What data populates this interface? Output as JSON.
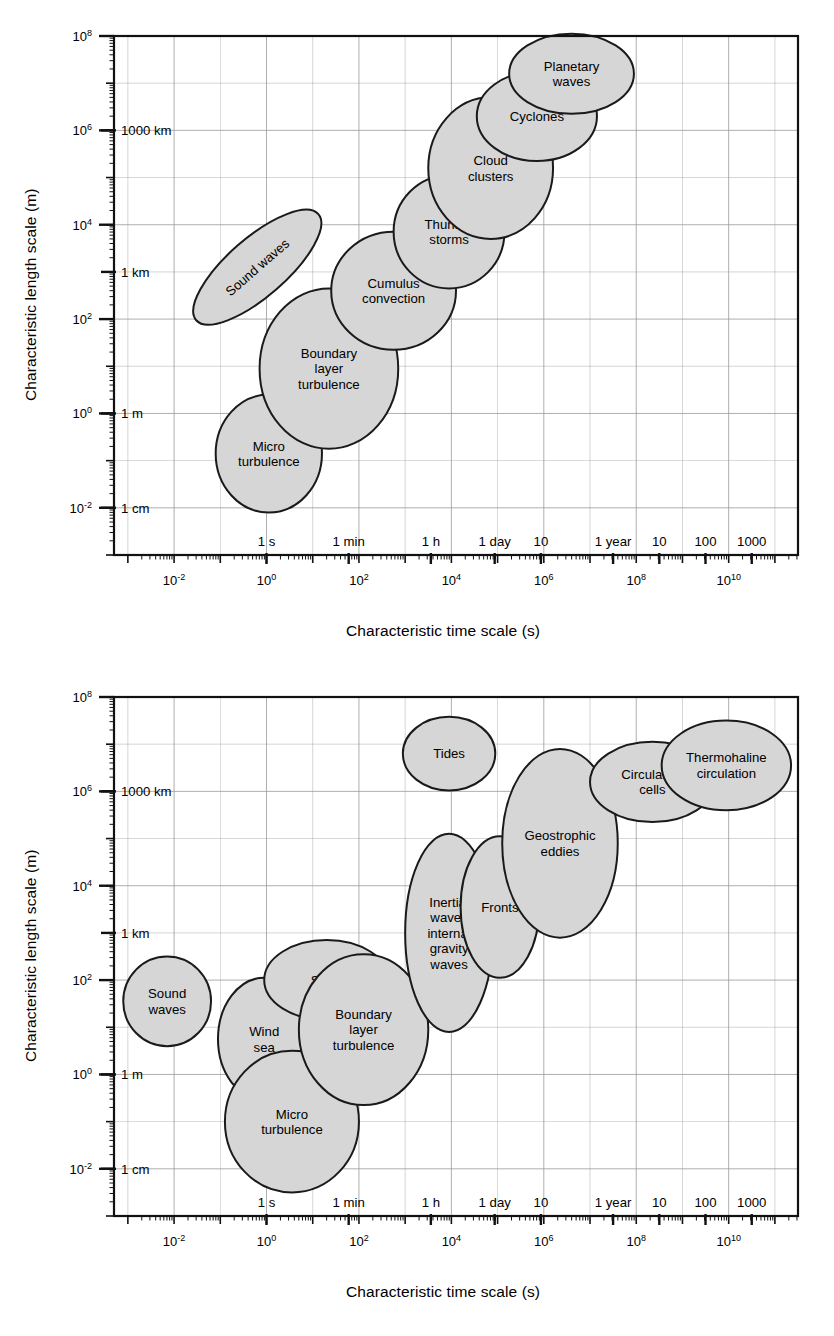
{
  "figure": {
    "panels": [
      {
        "id": "atmosphere",
        "xlabel": "Characteristic time scale (s)",
        "ylabel": "Characteristic length scale (m)"
      },
      {
        "id": "ocean",
        "xlabel": "Characteristic time scale (s)",
        "ylabel": "Characteristic length scale (m)"
      }
    ]
  },
  "chart_data": [
    {
      "type": "scatter",
      "id": "atmospheric-scales",
      "title": "",
      "xlabel": "Characteristic time scale (s)",
      "ylabel": "Characteristic length scale (m)",
      "xscale": "log",
      "yscale": "log",
      "xlim": [
        -3.3,
        11.5
      ],
      "ylim": [
        -3.0,
        8.0
      ],
      "grid": true,
      "legend": "none",
      "x_decade_ticks": [
        "10-2",
        "100",
        "102",
        "104",
        "106",
        "108",
        "1010"
      ],
      "x_decade_values": [
        -2,
        0,
        2,
        4,
        6,
        8,
        10
      ],
      "x_named_ticks": [
        {
          "label": "1 s",
          "log10_seconds": 0
        },
        {
          "label": "1 min",
          "log10_seconds": 1.778
        },
        {
          "label": "1 h",
          "log10_seconds": 3.556
        },
        {
          "label": "1 day",
          "log10_seconds": 4.937
        },
        {
          "label": "10",
          "log10_seconds": 5.937
        },
        {
          "label": "1 year",
          "log10_seconds": 7.499
        },
        {
          "label": "10",
          "log10_seconds": 8.499
        },
        {
          "label": "100",
          "log10_seconds": 9.499
        },
        {
          "label": "1000",
          "log10_seconds": 10.499
        }
      ],
      "y_decade_ticks": [
        "108",
        "106",
        "104",
        "102",
        "100",
        "10-2"
      ],
      "y_decade_values": [
        8,
        6,
        4,
        2,
        0,
        -2
      ],
      "y_named_ticks": [
        {
          "label": "1000 km",
          "log10_metres": 6
        },
        {
          "label": "1 km",
          "log10_metres": 3
        },
        {
          "label": "1 m",
          "log10_metres": 0
        },
        {
          "label": "1 cm",
          "log10_metres": -2
        }
      ],
      "bubbles": [
        {
          "label": "Micro turbulence",
          "lines": [
            "Micro",
            "turbulence"
          ],
          "cx_log10s": 0.05,
          "cy_log10m": -0.85,
          "rx_dec": 1.15,
          "ry_dec": 1.25,
          "rotate": 0
        },
        {
          "label": "Boundary layer turbulence",
          "lines": [
            "Boundary",
            "layer",
            "turbulence"
          ],
          "cx_log10s": 1.35,
          "cy_log10m": 0.95,
          "rx_dec": 1.5,
          "ry_dec": 1.7,
          "rotate": 0
        },
        {
          "label": "Sound waves",
          "lines": [
            "Sound waves"
          ],
          "cx_log10s": -0.2,
          "cy_log10m": 3.1,
          "rx_dec": 1.75,
          "ry_dec": 0.62,
          "rotate": -41
        },
        {
          "label": "Cumulus convection",
          "lines": [
            "Cumulus",
            "convection"
          ],
          "cx_log10s": 2.75,
          "cy_log10m": 2.6,
          "rx_dec": 1.35,
          "ry_dec": 1.25,
          "rotate": 0
        },
        {
          "label": "Thunder storms",
          "lines": [
            "Thunder",
            "storms"
          ],
          "cx_log10s": 3.95,
          "cy_log10m": 3.85,
          "rx_dec": 1.2,
          "ry_dec": 1.2,
          "rotate": 0
        },
        {
          "label": "Cloud clusters",
          "lines": [
            "Cloud",
            "clusters"
          ],
          "cx_log10s": 4.85,
          "cy_log10m": 5.2,
          "rx_dec": 1.35,
          "ry_dec": 1.5,
          "rotate": 0
        },
        {
          "label": "Cyclones",
          "lines": [
            "Cyclones"
          ],
          "cx_log10s": 5.85,
          "cy_log10m": 6.3,
          "rx_dec": 1.3,
          "ry_dec": 0.95,
          "rotate": 0
        },
        {
          "label": "Planetary waves",
          "lines": [
            "Planetary",
            "waves"
          ],
          "cx_log10s": 6.6,
          "cy_log10m": 7.2,
          "rx_dec": 1.35,
          "ry_dec": 0.85,
          "rotate": 0
        }
      ]
    },
    {
      "type": "scatter",
      "id": "oceanic-scales",
      "title": "",
      "xlabel": "Characteristic time scale (s)",
      "ylabel": "Characteristic length scale (m)",
      "xscale": "log",
      "yscale": "log",
      "xlim": [
        -3.3,
        11.5
      ],
      "ylim": [
        -3.0,
        8.0
      ],
      "grid": true,
      "legend": "none",
      "x_decade_ticks": [
        "10-2",
        "100",
        "102",
        "104",
        "106",
        "108",
        "1010"
      ],
      "x_decade_values": [
        -2,
        0,
        2,
        4,
        6,
        8,
        10
      ],
      "x_named_ticks": [
        {
          "label": "1 s",
          "log10_seconds": 0
        },
        {
          "label": "1 min",
          "log10_seconds": 1.778
        },
        {
          "label": "1 h",
          "log10_seconds": 3.556
        },
        {
          "label": "1 day",
          "log10_seconds": 4.937
        },
        {
          "label": "10",
          "log10_seconds": 5.937
        },
        {
          "label": "1 year",
          "log10_seconds": 7.499
        },
        {
          "label": "10",
          "log10_seconds": 8.499
        },
        {
          "label": "100",
          "log10_seconds": 9.499
        },
        {
          "label": "1000",
          "log10_seconds": 10.499
        }
      ],
      "y_decade_ticks": [
        "108",
        "106",
        "104",
        "102",
        "100",
        "10-2"
      ],
      "y_decade_values": [
        8,
        6,
        4,
        2,
        0,
        -2
      ],
      "y_named_ticks": [
        {
          "label": "1000 km",
          "log10_metres": 6
        },
        {
          "label": "1 km",
          "log10_metres": 3
        },
        {
          "label": "1 m",
          "log10_metres": 0
        },
        {
          "label": "1 cm",
          "log10_metres": -2
        }
      ],
      "bubbles": [
        {
          "label": "Sound waves",
          "lines": [
            "Sound",
            "waves"
          ],
          "cx_log10s": -2.15,
          "cy_log10m": 1.55,
          "rx_dec": 0.95,
          "ry_dec": 0.95,
          "rotate": 0
        },
        {
          "label": "Wind sea",
          "lines": [
            "Wind",
            "sea"
          ],
          "cx_log10s": -0.05,
          "cy_log10m": 0.75,
          "rx_dec": 1.0,
          "ry_dec": 1.3,
          "rotate": 0
        },
        {
          "label": "Micro turbulence",
          "lines": [
            "Micro",
            "turbulence"
          ],
          "cx_log10s": 0.55,
          "cy_log10m": -1.0,
          "rx_dec": 1.45,
          "ry_dec": 1.5,
          "rotate": 0
        },
        {
          "label": "Swell",
          "lines": [
            "Swell"
          ],
          "cx_log10s": 1.3,
          "cy_log10m": 2.0,
          "rx_dec": 1.35,
          "ry_dec": 0.85,
          "rotate": 0
        },
        {
          "label": "Boundary layer turbulence",
          "lines": [
            "Boundary",
            "layer",
            "turbulence"
          ],
          "cx_log10s": 2.1,
          "cy_log10m": 0.95,
          "rx_dec": 1.4,
          "ry_dec": 1.6,
          "rotate": 0
        },
        {
          "label": "Inertial waves internal gravity waves",
          "lines": [
            "Inertial",
            "waves",
            "internal",
            "gravity",
            "waves"
          ],
          "cx_log10s": 3.95,
          "cy_log10m": 3.0,
          "rx_dec": 0.95,
          "ry_dec": 2.1,
          "rotate": 0
        },
        {
          "label": "Fronts",
          "lines": [
            "Fronts"
          ],
          "cx_log10s": 5.05,
          "cy_log10m": 3.55,
          "rx_dec": 0.85,
          "ry_dec": 1.5,
          "rotate": 0
        },
        {
          "label": "Geostrophic eddies",
          "lines": [
            "Geostrophic",
            "eddies"
          ],
          "cx_log10s": 6.35,
          "cy_log10m": 4.9,
          "rx_dec": 1.25,
          "ry_dec": 2.0,
          "rotate": 0
        },
        {
          "label": "Tides",
          "lines": [
            "Tides"
          ],
          "cx_log10s": 3.95,
          "cy_log10m": 6.8,
          "rx_dec": 1.0,
          "ry_dec": 0.78,
          "rotate": 0
        },
        {
          "label": "Circulation cells",
          "lines": [
            "Circulation",
            "cells"
          ],
          "cx_log10s": 8.35,
          "cy_log10m": 6.2,
          "rx_dec": 1.35,
          "ry_dec": 0.85,
          "rotate": 0
        },
        {
          "label": "Thermohaline circulation",
          "lines": [
            "Thermohaline",
            "circulation"
          ],
          "cx_log10s": 9.95,
          "cy_log10m": 6.55,
          "rx_dec": 1.4,
          "ry_dec": 0.95,
          "rotate": 0
        }
      ]
    }
  ],
  "style": {
    "bubble_fill": "#d6d6d6",
    "bubble_stroke": "#1a1a1a",
    "grid_color": "#9a9a9a",
    "frame_color": "#111111",
    "text_color": "#000000"
  }
}
